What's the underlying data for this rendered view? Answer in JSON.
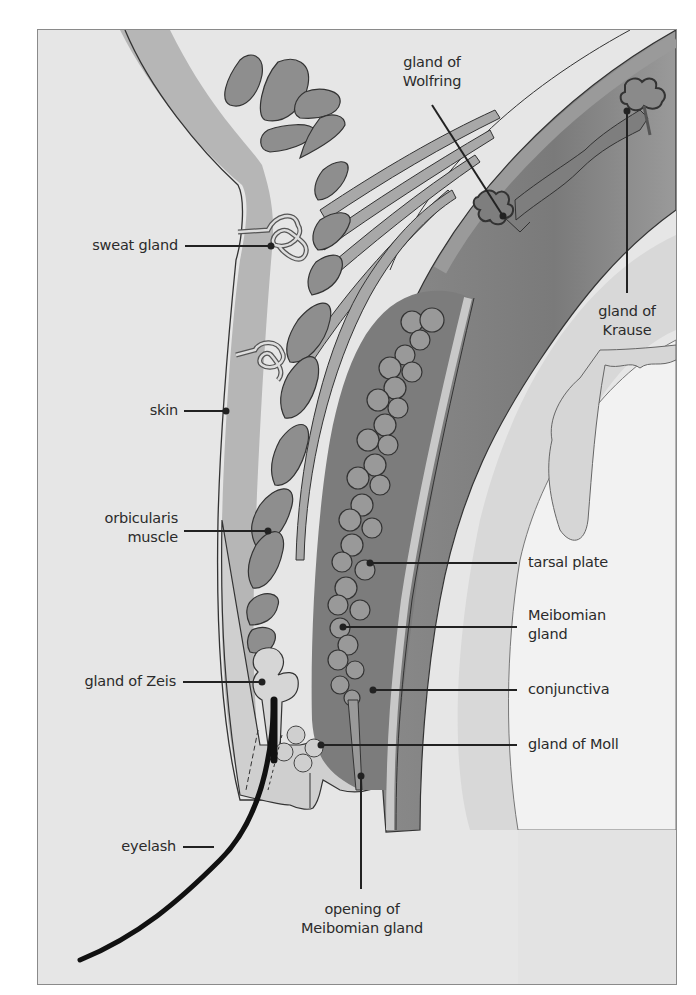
{
  "figure": {
    "colors": {
      "background": "#e6e6e6",
      "frame_border": "#8a8a8a",
      "tissue_light": "#bdbdbd",
      "tissue_mid": "#9a9a9a",
      "tissue_dark": "#7e7e7e",
      "outline": "#333333",
      "label_text": "#2b2b2b",
      "cornea_light": "#f0f0f0"
    }
  },
  "labels": {
    "sweat_gland": "sweat gland",
    "skin": "skin",
    "orbicularis_muscle": [
      "orbicularis",
      "muscle"
    ],
    "gland_of_zeis": "gland of Zeis",
    "eyelash": "eyelash",
    "gland_of_wolfring": [
      "gland of",
      "Wolfring"
    ],
    "gland_of_krause": [
      "gland of",
      "Krause"
    ],
    "tarsal_plate": "tarsal plate",
    "meibomian_gland": [
      "Meibomian",
      "gland"
    ],
    "conjunctiva": "conjunctiva",
    "gland_of_moll": "gland of Moll",
    "opening_of_meibomian_gland": [
      "opening of",
      "Meibomian gland"
    ]
  }
}
